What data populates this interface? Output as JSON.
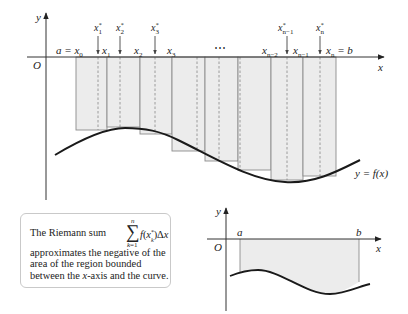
{
  "main_plot": {
    "axis_x_label": "x",
    "axis_y_label": "y",
    "origin_label": "O",
    "curve_label": "y = f(x)",
    "partition_labels": [
      {
        "id": "x0",
        "text": "a = x",
        "sub": "0"
      },
      {
        "id": "x1",
        "text": "x",
        "sub": "1"
      },
      {
        "id": "x2",
        "text": "x",
        "sub": "2"
      },
      {
        "id": "x3",
        "text": "x",
        "sub": "3"
      },
      {
        "id": "xn-2",
        "text": "x",
        "sub": "n−2"
      },
      {
        "id": "xn-1",
        "text": "x",
        "sub": "n−1"
      },
      {
        "id": "xn",
        "text": "x",
        "sub": "n",
        "suffix": " = b"
      }
    ],
    "sample_labels": [
      {
        "text": "x",
        "sup": "*",
        "sub": "1"
      },
      {
        "text": "x",
        "sup": "*",
        "sub": "2"
      },
      {
        "text": "x",
        "sup": "*",
        "sub": "3"
      },
      {
        "text": "x",
        "sup": "*",
        "sub": "n−1"
      },
      {
        "text": "x",
        "sup": "*",
        "sub": "n"
      }
    ],
    "ellipsis": "⋯",
    "colors": {
      "rect_fill": "#ececec",
      "rect_stroke": "#8c8c8c",
      "curve": "#1a1a1a",
      "axis": "#333333"
    }
  },
  "note": {
    "lead": "The Riemann sum",
    "sum_symbol": "∑",
    "sum_upper": "n",
    "sum_lower_var": "k",
    "sum_lower_rest": "=1",
    "sum_expr_f": "f",
    "sum_expr_open": "(",
    "sum_expr_x": "x",
    "sum_expr_sup": "*",
    "sum_expr_sub": "k",
    "sum_expr_close": ")Δ",
    "sum_expr_dx": "x",
    "line2": "approximates the negative of the",
    "line3": "area of the region bounded",
    "line4_pre": "between the ",
    "line4_var": "x",
    "line4_post": "-axis and the curve."
  },
  "small_plot": {
    "axis_x_label": "x",
    "axis_y_label": "y",
    "origin_label": "O",
    "a_label": "a",
    "b_label": "b"
  }
}
